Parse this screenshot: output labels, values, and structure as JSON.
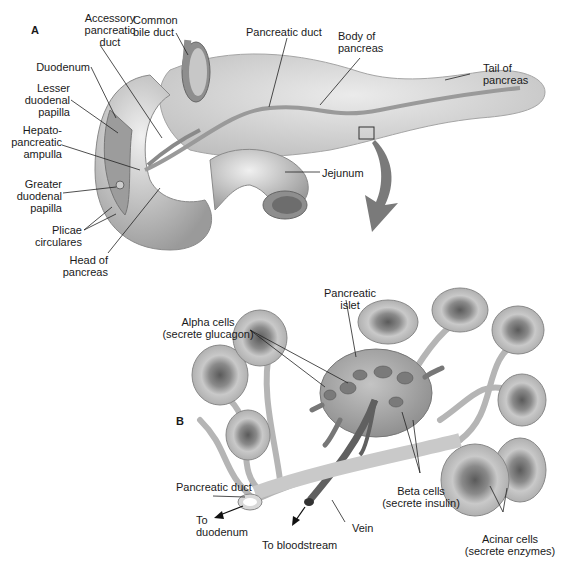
{
  "figure": {
    "panel_a": {
      "letter": "A",
      "labels": {
        "accessory_duct": [
          "Accessory",
          "pancreatic",
          "duct"
        ],
        "common_bile_duct": [
          "Common",
          "bile duct"
        ],
        "pancreatic_duct": "Pancreatic duct",
        "body": [
          "Body of",
          "pancreas"
        ],
        "tail": [
          "Tail of",
          "pancreas"
        ],
        "duodenum": "Duodenum",
        "lesser_papilla": [
          "Lesser",
          "duodenal",
          "papilla"
        ],
        "hepato_ampulla": [
          "Hepato-",
          "pancreatic",
          "ampulla"
        ],
        "greater_papilla": [
          "Greater",
          "duodenal",
          "papilla"
        ],
        "plicae": [
          "Plicae",
          "circulares"
        ],
        "head": [
          "Head of",
          "pancreas"
        ],
        "jejunum": "Jejunum"
      }
    },
    "panel_b": {
      "letter": "B",
      "labels": {
        "islet": [
          "Pancreatic",
          "islet"
        ],
        "alpha": [
          "Alpha cells",
          "(secrete glucagon)"
        ],
        "beta": [
          "Beta cells",
          "(secrete insulin)"
        ],
        "acinar": [
          "Acinar cells",
          "(secrete enzymes)"
        ],
        "pancreatic_duct": "Pancreatic duct",
        "to_duodenum": [
          "To",
          "duodenum"
        ],
        "to_bloodstream": "To bloodstream",
        "vein": "Vein"
      }
    },
    "colors": {
      "tissue": "#d6d6d6",
      "tissue_dark": "#8f8f8f",
      "duct": "#9a9a9a",
      "vessel": "#6e6e6e",
      "arrow": "#7a7a7a"
    }
  }
}
